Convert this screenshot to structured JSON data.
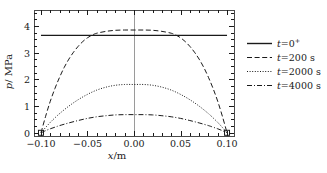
{
  "chart_data": {
    "type": "line",
    "title": "",
    "xlabel": "x/m",
    "ylabel": "p/ MPa",
    "xlabel_symbol": "x",
    "xlabel_unit": "/m",
    "ylabel_symbol": "p",
    "ylabel_unit": "/ MPa",
    "xlim": [
      -0.1075,
      0.1075
    ],
    "ylim": [
      -0.12,
      4.6
    ],
    "xticks": [
      -0.1,
      -0.05,
      0,
      0.05,
      0.1
    ],
    "xticklabels": [
      "−0.10",
      "−0.05",
      "0.00",
      "0.05",
      "0.10"
    ],
    "yticks": [
      0,
      1,
      2,
      3,
      4
    ],
    "yticklabels": [
      "0",
      "1",
      "2",
      "3",
      "4"
    ],
    "minor_xticks": true,
    "minor_yticks": true,
    "grid": false,
    "legend_position": "right",
    "center_line_x": 0.0,
    "series": [
      {
        "name": "t=0⁺",
        "label_symbol": "t",
        "label_rest": "=0",
        "label_sup": "+",
        "style": "solid",
        "color": "#1a1a1a",
        "x": [
          -0.1,
          -0.075,
          -0.05,
          -0.025,
          0,
          0.025,
          0.05,
          0.075,
          0.1
        ],
        "y": [
          3.65,
          3.65,
          3.65,
          3.65,
          3.65,
          3.65,
          3.65,
          3.65,
          3.65
        ]
      },
      {
        "name": "t=200 s",
        "label_symbol": "t",
        "label_rest": "=200 s",
        "label_sup": "",
        "style": "dashed",
        "color": "#1a1a1a",
        "x": [
          -0.1,
          -0.095,
          -0.09,
          -0.085,
          -0.08,
          -0.075,
          -0.07,
          -0.065,
          -0.06,
          -0.055,
          -0.05,
          -0.045,
          -0.04,
          -0.03,
          -0.02,
          -0.01,
          0,
          0.01,
          0.02,
          0.03,
          0.04,
          0.045,
          0.05,
          0.055,
          0.06,
          0.065,
          0.07,
          0.075,
          0.08,
          0.085,
          0.09,
          0.095,
          0.1
        ],
        "y": [
          0.0,
          0.62,
          1.18,
          1.66,
          2.08,
          2.45,
          2.76,
          3.02,
          3.24,
          3.42,
          3.56,
          3.66,
          3.73,
          3.8,
          3.84,
          3.85,
          3.85,
          3.85,
          3.84,
          3.8,
          3.73,
          3.66,
          3.56,
          3.42,
          3.24,
          3.02,
          2.76,
          2.45,
          2.08,
          1.66,
          1.18,
          0.62,
          0.0
        ]
      },
      {
        "name": "t=2000 s",
        "label_symbol": "t",
        "label_rest": "=2000 s",
        "label_sup": "",
        "style": "dotted",
        "color": "#1a1a1a",
        "x": [
          -0.1,
          -0.095,
          -0.09,
          -0.085,
          -0.08,
          -0.07,
          -0.06,
          -0.05,
          -0.04,
          -0.03,
          -0.02,
          -0.01,
          0,
          0.01,
          0.02,
          0.03,
          0.04,
          0.05,
          0.06,
          0.07,
          0.08,
          0.085,
          0.09,
          0.095,
          0.1
        ],
        "y": [
          0.0,
          0.2,
          0.39,
          0.56,
          0.72,
          1.0,
          1.24,
          1.44,
          1.6,
          1.71,
          1.78,
          1.81,
          1.81,
          1.81,
          1.78,
          1.71,
          1.6,
          1.44,
          1.24,
          1.0,
          0.72,
          0.56,
          0.39,
          0.2,
          0.0
        ]
      },
      {
        "name": "t=4000 s",
        "label_symbol": "t",
        "label_rest": "=4000 s",
        "label_sup": "",
        "style": "dashdot",
        "color": "#1a1a1a",
        "x": [
          -0.1,
          -0.095,
          -0.09,
          -0.085,
          -0.08,
          -0.07,
          -0.06,
          -0.05,
          -0.04,
          -0.03,
          -0.02,
          -0.01,
          0,
          0.01,
          0.02,
          0.03,
          0.04,
          0.05,
          0.06,
          0.07,
          0.08,
          0.085,
          0.09,
          0.095,
          0.1
        ],
        "y": [
          0.0,
          0.08,
          0.15,
          0.21,
          0.27,
          0.37,
          0.46,
          0.54,
          0.6,
          0.64,
          0.67,
          0.68,
          0.68,
          0.68,
          0.67,
          0.64,
          0.6,
          0.54,
          0.46,
          0.37,
          0.27,
          0.21,
          0.15,
          0.08,
          0.0
        ]
      }
    ],
    "endpoint_markers": [
      {
        "x": -0.1,
        "y": 0.0
      },
      {
        "x": 0.1,
        "y": 0.0
      }
    ]
  }
}
